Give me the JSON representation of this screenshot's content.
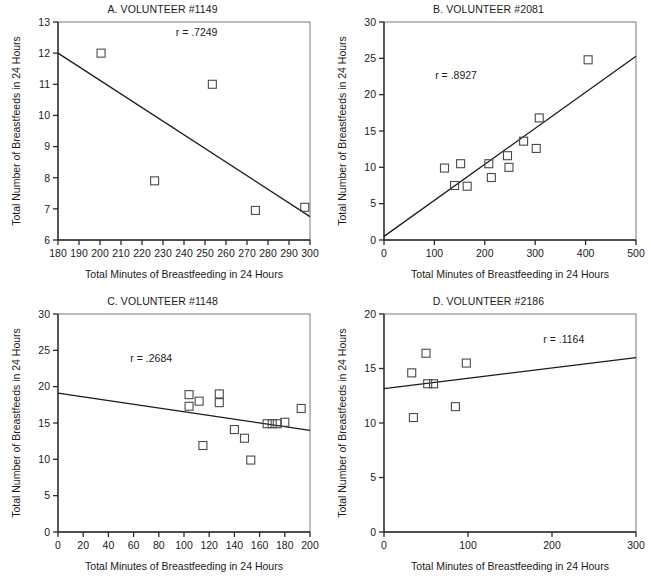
{
  "figure": {
    "axis_titles": {
      "x": "Total Minutes of Breastfeeding in 24 Hours",
      "y": "Total Number of Breastfeeds in 24 Hours"
    }
  },
  "chart_data": [
    {
      "type": "scatter",
      "panel": "A",
      "title": "A. VOLUNTEER #1149",
      "annotation": "r  =  .7249",
      "r": 0.7249,
      "xlabel": "Total Minutes of Breastfeeding in 24 Hours",
      "ylabel": "Total Number of Breastfeeds in 24 Hours",
      "xlim": [
        180,
        300
      ],
      "ylim": [
        6,
        13
      ],
      "xticks": [
        180,
        190,
        200,
        210,
        220,
        230,
        240,
        250,
        260,
        270,
        280,
        290,
        300
      ],
      "yticks": [
        6,
        7,
        8,
        9,
        10,
        11,
        12,
        13
      ],
      "grid": false,
      "points": [
        {
          "x": 200.5,
          "y": 12.0
        },
        {
          "x": 253.5,
          "y": 11.0
        },
        {
          "x": 226.0,
          "y": 7.9
        },
        {
          "x": 274.0,
          "y": 6.95
        },
        {
          "x": 297.5,
          "y": 7.05
        }
      ],
      "fit_line": {
        "x1": 180,
        "y1": 12.0,
        "x2": 300,
        "y2": 6.75
      }
    },
    {
      "type": "scatter",
      "panel": "B",
      "title": "B. VOLUNTEER #2081",
      "annotation": "r  =  .8927",
      "r": 0.8927,
      "xlabel": "Total Minutes of Breastfeeding in 24 Hours",
      "ylabel": "Total Number of Breastfeeds in 24 Hours",
      "xlim": [
        0,
        500
      ],
      "ylim": [
        0,
        30
      ],
      "xticks": [
        0,
        100,
        200,
        300,
        400,
        500
      ],
      "yticks": [
        0,
        5,
        10,
        15,
        20,
        25,
        30
      ],
      "grid": false,
      "points": [
        {
          "x": 120,
          "y": 9.9
        },
        {
          "x": 140,
          "y": 7.5
        },
        {
          "x": 152,
          "y": 10.5
        },
        {
          "x": 165,
          "y": 7.4
        },
        {
          "x": 208,
          "y": 10.5
        },
        {
          "x": 213,
          "y": 8.6
        },
        {
          "x": 245,
          "y": 11.6
        },
        {
          "x": 248,
          "y": 10.0
        },
        {
          "x": 277,
          "y": 13.6
        },
        {
          "x": 302,
          "y": 12.6
        },
        {
          "x": 308,
          "y": 16.8
        },
        {
          "x": 405,
          "y": 24.8
        }
      ],
      "fit_line": {
        "x1": 0,
        "y1": 0.5,
        "x2": 500,
        "y2": 25.3
      }
    },
    {
      "type": "scatter",
      "panel": "C",
      "title": "C. VOLUNTEER #1148",
      "annotation": "r  =  .2684",
      "r": 0.2684,
      "xlabel": "Total Minutes of Breastfeeding in 24 Hours",
      "ylabel": "Total Number of Breastfeeds in 24 Hours",
      "xlim": [
        0,
        200
      ],
      "ylim": [
        0,
        30
      ],
      "xticks": [
        0,
        20,
        40,
        60,
        80,
        100,
        120,
        140,
        160,
        180,
        200
      ],
      "yticks": [
        0,
        5,
        10,
        15,
        20,
        25,
        30
      ],
      "grid": false,
      "points": [
        {
          "x": 104,
          "y": 18.9
        },
        {
          "x": 104,
          "y": 17.3
        },
        {
          "x": 112,
          "y": 18.0
        },
        {
          "x": 115,
          "y": 11.9
        },
        {
          "x": 128,
          "y": 19.0
        },
        {
          "x": 128,
          "y": 17.8
        },
        {
          "x": 140,
          "y": 14.1
        },
        {
          "x": 148,
          "y": 12.9
        },
        {
          "x": 153,
          "y": 9.9
        },
        {
          "x": 166,
          "y": 14.9
        },
        {
          "x": 170,
          "y": 14.9
        },
        {
          "x": 174,
          "y": 14.9
        },
        {
          "x": 180,
          "y": 15.1
        },
        {
          "x": 193,
          "y": 17.0
        }
      ],
      "fit_line": {
        "x1": 0,
        "y1": 19.1,
        "x2": 200,
        "y2": 14.0
      }
    },
    {
      "type": "scatter",
      "panel": "D",
      "title": "D. VOLUNTEER #2186",
      "annotation": "r  =  .1164",
      "r": 0.1164,
      "xlabel": "Total Minutes of Breastfeeding in 24 Hours",
      "ylabel": "Total Number of Breastfeeds in 24 Hours",
      "xlim": [
        0,
        300
      ],
      "ylim": [
        0,
        20
      ],
      "xticks": [
        0,
        100,
        200,
        300
      ],
      "yticks": [
        0,
        5,
        10,
        15,
        20
      ],
      "grid": false,
      "points": [
        {
          "x": 35,
          "y": 10.5
        },
        {
          "x": 33,
          "y": 14.6
        },
        {
          "x": 50,
          "y": 16.4
        },
        {
          "x": 52,
          "y": 13.6
        },
        {
          "x": 59,
          "y": 13.6
        },
        {
          "x": 85,
          "y": 11.5
        },
        {
          "x": 98,
          "y": 15.5
        }
      ],
      "fit_line": {
        "x1": 0,
        "y1": 13.15,
        "x2": 300,
        "y2": 16.0
      }
    }
  ]
}
